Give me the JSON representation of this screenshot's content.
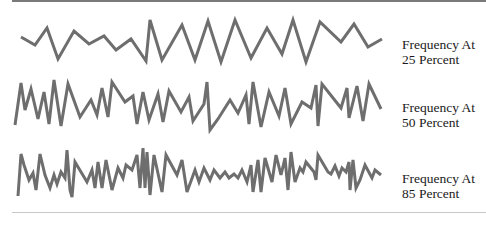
{
  "colors": {
    "wave": "#6e6e6e",
    "rule_top": "#7a7a7a",
    "rule_bottom": "#c8c8c8",
    "text": "#1a1a1a"
  },
  "waves": [
    {
      "label_line1": "Frequency At",
      "label_line2": "25 Percent",
      "points": "21,37 35,45 47,28 58,59 74,31 89,44 104,36 116,50 131,39 146,61 150,20 162,60 182,25 195,60 208,21 221,62 235,20 251,58 267,28 282,54 293,20 306,62 320,22 341,42 354,24 368,47 382,39"
    },
    {
      "label_line1": "Frequency At",
      "label_line2": "50 Percent",
      "points": "15,125 21,83 25,110 31,89 38,119 44,92 49,124 54,80 61,126 68,84 80,117 91,100 97,115 102,88 108,117 112,82 125,102 133,96 137,124 143,92 149,120 158,94 163,122 169,91 181,112 189,97 193,121 204,104 207,82 210,130 218,119 230,100 238,113 246,95 249,124 253,82 261,127 269,92 279,116 285,88 291,124 302,102 311,108 316,85 318,126 322,84 341,108 347,88 349,118 357,86 363,121 369,84 381,109"
    },
    {
      "label_line1": "Frequency At",
      "label_line2": "85 Percent",
      "points": "18,196 21,154 24,165 29,180 33,173 36,190 40,154 45,175 50,188 54,175 57,184 61,172 65,178 67,150 70,190 72,197 75,162 87,182 92,170 95,188 98,162 102,188 106,160 112,190 118,168 123,178 126,165 132,170 137,155 140,188 143,148 145,188 147,152 150,195 154,155 162,192 166,155 177,175 182,160 187,192 195,170 199,182 204,168 210,180 214,170 220,178 225,172 229,178 234,174 238,178 242,170 247,182 251,165 253,192 258,160 261,192 265,158 272,182 276,155 281,175 285,158 288,190 291,152 295,182 300,168 303,172 306,162 314,172 316,180 318,155 328,172 331,174 335,166 339,176 342,168 346,172 349,162 350,190 353,160 356,188 360,180 365,165 372,178 375,170 381,175"
    }
  ]
}
